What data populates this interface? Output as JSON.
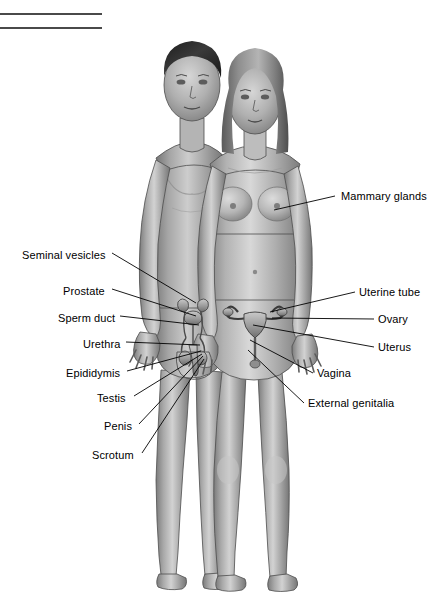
{
  "figure": {
    "background_color": "#ffffff",
    "line_color": "#000000",
    "skin_midtone": "#a8a8a8",
    "skin_highlight": "#d8d8d8",
    "skin_shadow": "#6f6f6f",
    "hair_dark": "#2e2e2e",
    "hair_light": "#8a8a8a"
  },
  "rules": [
    {
      "name": "rule-top"
    },
    {
      "name": "rule-bottom"
    }
  ],
  "labels_left": [
    {
      "text": "Seminal vesicles",
      "x": 22,
      "y": 249,
      "leader_x1": 112,
      "leader_y1": 253,
      "leader_x2": 196,
      "leader_y2": 303
    },
    {
      "text": "Prostate",
      "x": 63,
      "y": 285,
      "leader_x1": 112,
      "leader_y1": 289,
      "leader_x2": 196,
      "leader_y2": 316
    },
    {
      "text": "Sperm duct",
      "x": 58,
      "y": 312,
      "leader_x1": 120,
      "leader_y1": 316,
      "leader_x2": 199,
      "leader_y2": 325
    },
    {
      "text": "Urethra",
      "x": 83,
      "y": 338,
      "leader_x1": 126,
      "leader_y1": 342,
      "leader_x2": 200,
      "leader_y2": 345
    },
    {
      "text": "Epididymis",
      "x": 66,
      "y": 367,
      "leader_x1": 127,
      "leader_y1": 371,
      "leader_x2": 201,
      "leader_y2": 351
    },
    {
      "text": "Testis",
      "x": 97,
      "y": 392,
      "leader_x1": 134,
      "leader_y1": 396,
      "leader_x2": 202,
      "leader_y2": 354
    },
    {
      "text": "Penis",
      "x": 104,
      "y": 420,
      "leader_x1": 139,
      "leader_y1": 424,
      "leader_x2": 203,
      "leader_y2": 356
    },
    {
      "text": "Scrotum",
      "x": 92,
      "y": 449,
      "leader_x1": 142,
      "leader_y1": 453,
      "leader_x2": 204,
      "leader_y2": 359
    }
  ],
  "labels_right": [
    {
      "text": "Mammary glands",
      "x": 341,
      "y": 190,
      "leader_x1": 335,
      "leader_y1": 196,
      "leader_x2": 274,
      "leader_y2": 210
    },
    {
      "text": "Uterine tube",
      "x": 359,
      "y": 286,
      "leader_x1": 355,
      "leader_y1": 292,
      "leader_x2": 270,
      "leader_y2": 312
    },
    {
      "text": "Ovary",
      "x": 378,
      "y": 313,
      "leader_x1": 374,
      "leader_y1": 319,
      "leader_x2": 272,
      "leader_y2": 318
    },
    {
      "text": "Uterus",
      "x": 378,
      "y": 341,
      "leader_x1": 374,
      "leader_y1": 347,
      "leader_x2": 253,
      "leader_y2": 325
    },
    {
      "text": "Vagina",
      "x": 317,
      "y": 367,
      "leader_x1": 313,
      "leader_y1": 373,
      "leader_x2": 250,
      "leader_y2": 340
    },
    {
      "text": "External genitalia",
      "x": 308,
      "y": 397,
      "leader_x1": 304,
      "leader_y1": 403,
      "leader_x2": 248,
      "leader_y2": 350
    }
  ]
}
